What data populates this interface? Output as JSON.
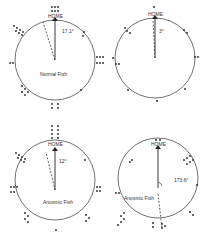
{
  "panels": [
    {
      "id": "normal",
      "title": "Normal Fish",
      "home_label": "HOME",
      "angle_label": "17.1°",
      "angle_deg": -17.1,
      "cx": 55,
      "cy": 60,
      "r": 40
    },
    {
      "id": "unlabeled",
      "title": "",
      "home_label": "HOME",
      "angle_label": "3°",
      "angle_deg": -3,
      "cx": 155,
      "cy": 58,
      "r": 40
    },
    {
      "id": "blind",
      "title": "Blind Fish",
      "home_label": "HOME",
      "angle_label": "12°",
      "angle_deg": -12,
      "cx": 55,
      "cy": 180,
      "r": 40
    },
    {
      "id": "anosmic",
      "title": "Anosmic Fish",
      "home_label": "HOME",
      "angle_label": "173.6°",
      "angle_deg": 173.6,
      "cx": 158,
      "cy": 178,
      "r": 40
    }
  ],
  "colors": {
    "line": "#222222",
    "text": "#333333"
  }
}
